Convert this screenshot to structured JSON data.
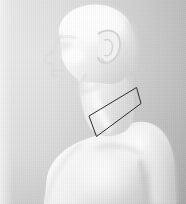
{
  "image": {
    "kind": "photograph",
    "subject": "human-bust-profile",
    "orientation": "left-facing-profile",
    "color_mode": "grayscale",
    "width": 186,
    "height": 204,
    "caption": ""
  },
  "background": {
    "top_left_color": "#e4e4e4",
    "bottom_right_color": "#bdbdbd",
    "texture": "vertical-scan-lines"
  },
  "subject": {
    "skin_highlight_color": "#fdfdfd",
    "skin_midtone_color": "#ececec",
    "skin_shadow_color": "#cfcfcf",
    "parts": [
      {
        "name": "head",
        "label": "Head"
      },
      {
        "name": "face-profile",
        "label": "Face (profile)"
      },
      {
        "name": "ear",
        "label": "Ear"
      },
      {
        "name": "jaw",
        "label": "Jaw"
      },
      {
        "name": "neck",
        "label": "Neck"
      },
      {
        "name": "trapezius",
        "label": "Trapezius"
      },
      {
        "name": "clavicle",
        "label": "Clavicle"
      },
      {
        "name": "shoulder",
        "label": "Shoulder"
      },
      {
        "name": "upper-arm",
        "label": "Upper arm"
      },
      {
        "name": "chest",
        "label": "Chest"
      }
    ]
  },
  "annotation": {
    "type": "quadrilateral-outline",
    "label": "",
    "stroke_color": "#2e2e2e",
    "stroke_width": 1,
    "fill": "none",
    "region": "neck-to-shoulder",
    "points": "136.5,87.5 141,103.5 96.5,136.5 89,116"
  }
}
